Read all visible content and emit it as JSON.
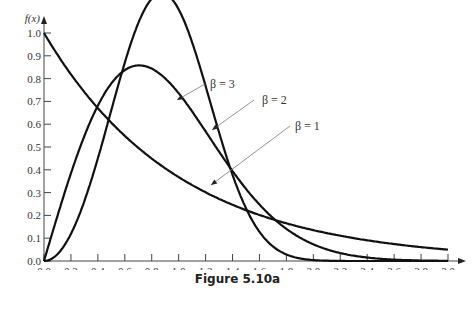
{
  "caption": "Figure 5.10a",
  "chart_data": {
    "type": "line",
    "title": "",
    "xlabel": "x",
    "ylabel": "f(x)",
    "xlim": [
      0.0,
      3.0
    ],
    "ylim": [
      0.0,
      1.0
    ],
    "grid": false,
    "legend": "inline annotations with arrows",
    "x_ticks": [
      "0.0",
      "0.2",
      "0.4",
      "0.6",
      "0.8",
      "1.0",
      "1.2",
      "1.4",
      "1.6",
      "1.8",
      "2.0",
      "2.2",
      "2.4",
      "2.6",
      "2.8",
      "3.0"
    ],
    "y_ticks": [
      "0.0",
      "0.1",
      "0.2",
      "0.3",
      "0.4",
      "0.5",
      "0.6",
      "0.7",
      "0.8",
      "0.9",
      "1.0"
    ],
    "x": [
      0.0,
      0.2,
      0.4,
      0.6,
      0.8,
      1.0,
      1.2,
      1.4,
      1.6,
      1.8,
      2.0,
      2.2,
      2.4,
      2.6,
      2.8,
      3.0
    ],
    "series": [
      {
        "name": "β = 1",
        "values": [
          1.0,
          0.819,
          0.67,
          0.549,
          0.449,
          0.368,
          0.301,
          0.247,
          0.202,
          0.165,
          0.135,
          0.111,
          0.091,
          0.074,
          0.061,
          0.05
        ]
      },
      {
        "name": "β = 2",
        "values": [
          0.0,
          0.384,
          0.681,
          0.837,
          0.844,
          0.736,
          0.57,
          0.394,
          0.248,
          0.141,
          0.073,
          0.035,
          0.015,
          0.006,
          0.002,
          0.001
        ]
      },
      {
        "name": "β = 3",
        "values": [
          0.0,
          0.119,
          0.451,
          0.87,
          1.065,
          1.104,
          0.762,
          0.377,
          0.127,
          0.029,
          0.004,
          0.0,
          0.0,
          0.0,
          0.0,
          0.0
        ]
      }
    ],
    "annotations": [
      {
        "text": "β = 3",
        "points_to_x": 1.05
      },
      {
        "text": "β = 2",
        "points_to_x": 1.35
      },
      {
        "text": "β = 1",
        "points_to_x": 1.45
      }
    ],
    "peaks": {
      "β = 2": {
        "x": 0.5,
        "y": 0.73
      },
      "β = 3": {
        "x": 0.68,
        "y": 0.81
      }
    }
  }
}
